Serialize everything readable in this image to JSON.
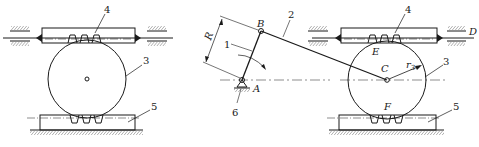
{
  "figure": {
    "colors": {
      "line": "#1a1a1a",
      "background": "#ffffff"
    }
  },
  "left_mechanism": {
    "labels": {
      "upper_rack": "4",
      "gear": "3",
      "lower_rack": "5"
    }
  },
  "linkage": {
    "labels": {
      "crank": "1",
      "connecting_rod": "2",
      "frame": "6",
      "pivot_a": "A",
      "joint_b": "B",
      "crank_length": "R"
    }
  },
  "right_mechanism": {
    "labels": {
      "upper_rack": "4",
      "gear": "3",
      "lower_rack": "5",
      "gear_center": "C",
      "upper_contact": "E",
      "lower_contact": "F",
      "rack_end": "D",
      "radius": "r",
      "radius_sub": "3"
    }
  }
}
